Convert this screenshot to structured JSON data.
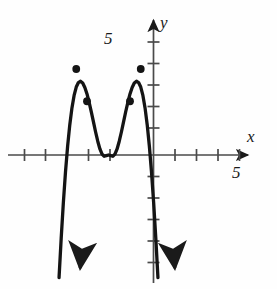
{
  "figure": {
    "kind": "coordinate-graph",
    "background": "#fefefe",
    "ink_color": "#1a1a1a"
  },
  "labels": {
    "y_axis_name": "y",
    "x_axis_name": "x",
    "y_tick_label": "5",
    "x_tick_label": "5"
  },
  "chart_data": {
    "type": "line",
    "title": "",
    "xlabel": "x",
    "ylabel": "y",
    "xlim": [
      -6,
      6.5
    ],
    "ylim": [
      -6.5,
      6
    ],
    "grid": false,
    "legend": null,
    "axes": {
      "x_axis_y_value": 0,
      "y_axis_x_value": 0,
      "x_ticks": [
        -5,
        -4,
        -3,
        -2,
        -1,
        1,
        2,
        3,
        4,
        5
      ],
      "y_ticks": [
        -6,
        -5,
        -4,
        -3,
        -2,
        -1,
        1,
        2,
        3,
        4,
        5
      ],
      "labeled_x_ticks": [
        {
          "value": 5,
          "text": "5"
        }
      ],
      "labeled_y_ticks": [
        {
          "value": 5,
          "text": "5"
        }
      ],
      "x_arrow": "right",
      "y_arrow": "both",
      "tick_spacing_px": 21.5,
      "origin_px": [
        131,
        155
      ]
    },
    "curve": {
      "description": "quartic polynomial, negative leading coefficient, W-shaped top",
      "equation_form": "y = -a*x^2*(x^2 - b)",
      "end_behavior": "down-left, down-right",
      "x": [
        -2.3,
        -2.2,
        -2.1,
        -2.0,
        -1.9,
        -1.8,
        -1.7,
        -1.6,
        -1.5,
        -1.4,
        -1.3,
        -1.2,
        -1.1,
        -1.0,
        -0.9,
        -0.8,
        -0.7,
        -0.6,
        -0.5,
        -0.4,
        -0.3,
        -0.2,
        -0.1,
        0.0,
        0.1,
        0.2,
        0.3,
        0.4,
        0.5,
        0.6,
        0.7,
        0.8,
        0.9,
        1.0,
        1.1,
        1.2,
        1.3,
        1.4,
        1.5,
        1.6,
        1.7,
        1.8,
        1.9,
        2.0,
        2.1,
        2.2,
        2.3
      ],
      "y": [
        -5.7,
        -3.87,
        -2.22,
        -0.79,
        0.42,
        1.41,
        2.19,
        2.77,
        3.16,
        3.37,
        3.43,
        3.35,
        3.14,
        2.84,
        2.45,
        2.01,
        1.54,
        1.07,
        0.64,
        0.28,
        0.04,
        -0.06,
        -0.03,
        0.0,
        -0.03,
        -0.06,
        0.04,
        0.28,
        0.64,
        1.07,
        1.54,
        2.01,
        2.45,
        2.84,
        3.14,
        3.35,
        3.43,
        3.37,
        3.16,
        2.77,
        2.19,
        1.41,
        0.42,
        -0.79,
        -2.22,
        -3.87,
        -5.7
      ]
    },
    "marked_points": [
      {
        "x": -1.5,
        "y": 4.0,
        "style": "filled-dot"
      },
      {
        "x": -1.0,
        "y": 2.5,
        "style": "filled-dot"
      },
      {
        "x": 1.0,
        "y": 2.5,
        "style": "filled-dot"
      },
      {
        "x": 1.5,
        "y": 4.0,
        "style": "filled-dot"
      }
    ],
    "x_intercepts": [
      -2,
      0,
      2
    ],
    "annotations": []
  }
}
